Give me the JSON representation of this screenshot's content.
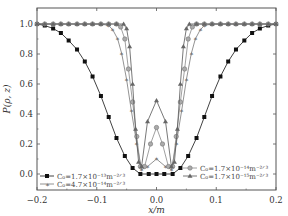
{
  "chart_data": {
    "type": "line",
    "title": "",
    "xlabel": "x/m",
    "ylabel": "P(ρ, z)",
    "xlim": [
      -0.2,
      0.2
    ],
    "ylim": [
      -0.1,
      1.1
    ],
    "xticks": [
      -0.2,
      -0.1,
      0.0,
      0.1,
      0.2
    ],
    "xtick_labels": [
      "−0.2",
      "−0.1",
      "0.0",
      "0.1",
      "0.2"
    ],
    "yticks": [
      0.0,
      0.2,
      0.4,
      0.6,
      0.8,
      1.0
    ],
    "ytick_labels": [
      "0.0",
      "0.2",
      "0.4",
      "0.6",
      "0.8",
      "1.0"
    ],
    "grid": false,
    "legend_position": "lower-left and lower-right",
    "series": [
      {
        "name": "C0=1.7×10^-13 m^-2/3",
        "legend_label": "C₀=1.7×10⁻¹³m⁻²ᐟ³",
        "marker": "square",
        "color": "#111111",
        "x": [
          -0.2,
          -0.187,
          -0.173,
          -0.16,
          -0.147,
          -0.133,
          -0.12,
          -0.107,
          -0.093,
          -0.08,
          -0.067,
          -0.053,
          -0.04,
          -0.027,
          -0.013,
          0.0,
          0.013,
          0.027,
          0.04,
          0.053,
          0.067,
          0.08,
          0.093,
          0.107,
          0.12,
          0.133,
          0.147,
          0.16,
          0.173,
          0.187,
          0.2
        ],
        "y": [
          1.0,
          0.99,
          0.97,
          0.94,
          0.89,
          0.83,
          0.75,
          0.65,
          0.52,
          0.38,
          0.24,
          0.12,
          0.04,
          0.0,
          0.0,
          0.0,
          0.0,
          0.0,
          0.04,
          0.12,
          0.24,
          0.38,
          0.52,
          0.65,
          0.75,
          0.83,
          0.89,
          0.94,
          0.97,
          0.99,
          1.0
        ]
      },
      {
        "name": "C0=4.7×10^-14 m^-2/3",
        "legend_label": "C₀=4.7×10⁻¹⁴m⁻²ᐟ³",
        "marker": "star",
        "color": "#777777",
        "x": [
          -0.2,
          -0.187,
          -0.173,
          -0.16,
          -0.147,
          -0.133,
          -0.12,
          -0.107,
          -0.093,
          -0.08,
          -0.073,
          -0.065,
          -0.058,
          -0.05,
          -0.042,
          -0.033,
          -0.025,
          -0.015,
          0.0,
          0.015,
          0.025,
          0.033,
          0.042,
          0.05,
          0.058,
          0.065,
          0.073,
          0.08,
          0.093,
          0.107,
          0.12,
          0.133,
          0.147,
          0.16,
          0.173,
          0.187,
          0.2
        ],
        "y": [
          1.0,
          1.0,
          1.0,
          1.0,
          1.0,
          1.0,
          1.0,
          1.0,
          1.0,
          0.99,
          0.96,
          0.9,
          0.8,
          0.63,
          0.42,
          0.2,
          0.03,
          0.05,
          0.1,
          0.05,
          0.03,
          0.2,
          0.42,
          0.63,
          0.8,
          0.9,
          0.96,
          0.99,
          1.0,
          1.0,
          1.0,
          1.0,
          1.0,
          1.0,
          1.0,
          1.0,
          1.0
        ]
      },
      {
        "name": "C0=1.7×10^-14 m^-2/3",
        "legend_label": "C₀=1.7×10⁻¹⁴m⁻²ᐟ³",
        "marker": "circle",
        "color": "#888888",
        "x": [
          -0.2,
          -0.187,
          -0.173,
          -0.16,
          -0.147,
          -0.133,
          -0.12,
          -0.107,
          -0.093,
          -0.08,
          -0.067,
          -0.06,
          -0.053,
          -0.047,
          -0.04,
          -0.033,
          -0.027,
          -0.02,
          -0.01,
          0.0,
          0.01,
          0.02,
          0.027,
          0.033,
          0.04,
          0.047,
          0.053,
          0.06,
          0.067,
          0.08,
          0.093,
          0.107,
          0.12,
          0.133,
          0.147,
          0.16,
          0.173,
          0.187,
          0.2
        ],
        "y": [
          1.0,
          1.0,
          1.0,
          1.0,
          1.0,
          1.0,
          1.0,
          1.0,
          1.0,
          1.0,
          1.0,
          0.98,
          0.9,
          0.7,
          0.48,
          0.25,
          0.05,
          0.05,
          0.2,
          0.31,
          0.2,
          0.05,
          0.05,
          0.25,
          0.48,
          0.7,
          0.9,
          0.98,
          1.0,
          1.0,
          1.0,
          1.0,
          1.0,
          1.0,
          1.0,
          1.0,
          1.0,
          1.0,
          1.0
        ]
      },
      {
        "name": "C0=1.7×10^-15 m^-2/3",
        "legend_label": "C₀=1.7×10⁻¹⁵m⁻²ᐟ³",
        "marker": "triangle",
        "color": "#555555",
        "x": [
          -0.2,
          -0.187,
          -0.173,
          -0.16,
          -0.147,
          -0.133,
          -0.12,
          -0.107,
          -0.093,
          -0.08,
          -0.067,
          -0.055,
          -0.05,
          -0.045,
          -0.04,
          -0.035,
          -0.03,
          -0.025,
          -0.015,
          0.0,
          0.015,
          0.025,
          0.03,
          0.035,
          0.04,
          0.045,
          0.05,
          0.055,
          0.067,
          0.08,
          0.093,
          0.107,
          0.12,
          0.133,
          0.147,
          0.16,
          0.173,
          0.187,
          0.2
        ],
        "y": [
          1.0,
          1.0,
          1.0,
          1.0,
          1.0,
          1.0,
          1.0,
          1.0,
          1.0,
          1.0,
          1.0,
          1.0,
          0.97,
          0.85,
          0.6,
          0.3,
          0.08,
          0.05,
          0.35,
          0.49,
          0.35,
          0.05,
          0.08,
          0.3,
          0.6,
          0.85,
          0.97,
          1.0,
          1.0,
          1.0,
          1.0,
          1.0,
          1.0,
          1.0,
          1.0,
          1.0,
          1.0,
          1.0,
          1.0
        ]
      }
    ]
  },
  "axes": {
    "xlabel": "x/m",
    "ylabel": "P(ρ, z)",
    "xtick_labels": [
      "−0.2",
      "−0.1",
      "0.0",
      "0.1",
      "0.2"
    ],
    "ytick_labels": [
      "0.0",
      "0.2",
      "0.4",
      "0.6",
      "0.8",
      "1.0"
    ]
  },
  "legend": {
    "left": [
      {
        "marker": "square",
        "label": "C₀=1.7×10⁻¹³m⁻²ᐟ³"
      },
      {
        "marker": "star",
        "label": "C₀=4.7×10⁻¹⁴m⁻²ᐟ³"
      }
    ],
    "right": [
      {
        "marker": "circle",
        "label": "C₀=1.7×10⁻¹⁴m⁻²ᐟ³"
      },
      {
        "marker": "triangle",
        "label": "C₀=1.7×10⁻¹⁵m⁻²ᐟ³"
      }
    ]
  }
}
